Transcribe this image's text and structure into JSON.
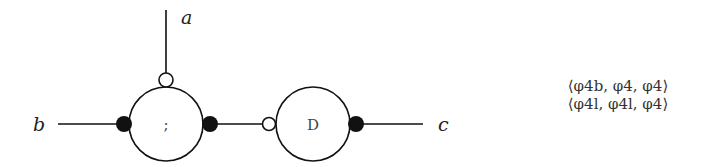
{
  "diagram": {
    "ports": {
      "a": "a",
      "b": "b",
      "c": "c"
    },
    "nodes": [
      {
        "id": "seq",
        "label": ";"
      },
      {
        "id": "D",
        "label": "D"
      }
    ],
    "connectors": {
      "seq_top": "open",
      "seq_left": "filled",
      "seq_right": "filled",
      "D_left": "open",
      "D_right": "filled"
    },
    "colors": {
      "stroke": "#111111",
      "background": "#ffffff"
    }
  },
  "formulas": [
    "⟨φ4b, φ4, φ4⟩",
    "⟨φ4l, φ4l, φ4⟩"
  ]
}
